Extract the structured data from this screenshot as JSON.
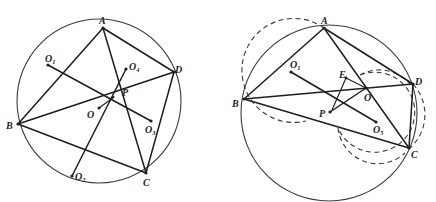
{
  "figures": [
    {
      "id": "left",
      "circle_label": "circumcircle",
      "points": [
        {
          "name": "A",
          "label": "A"
        },
        {
          "name": "B",
          "label": "B"
        },
        {
          "name": "C",
          "label": "C"
        },
        {
          "name": "D",
          "label": "D"
        },
        {
          "name": "O",
          "label": "O"
        },
        {
          "name": "P",
          "label": "P"
        },
        {
          "name": "O1",
          "label": "O",
          "sub": "1"
        },
        {
          "name": "O2",
          "label": "O",
          "sub": "2"
        },
        {
          "name": "O3",
          "label": "O",
          "sub": "3"
        },
        {
          "name": "O4",
          "label": "O",
          "sub": "4"
        }
      ],
      "segments": [
        "AB",
        "AD",
        "AC",
        "BD",
        "BC",
        "DC",
        "O1-O3",
        "O2-O4"
      ]
    },
    {
      "id": "right",
      "circle_label": "circumcircle",
      "points": [
        {
          "name": "A",
          "label": "A"
        },
        {
          "name": "B",
          "label": "B"
        },
        {
          "name": "C",
          "label": "C"
        },
        {
          "name": "D",
          "label": "D"
        },
        {
          "name": "E",
          "label": "E"
        },
        {
          "name": "O",
          "label": "O"
        },
        {
          "name": "P",
          "label": "P"
        },
        {
          "name": "O1",
          "label": "O",
          "sub": "1"
        },
        {
          "name": "O5",
          "label": "O",
          "sub": "5"
        }
      ],
      "segments": [
        "AB",
        "AD",
        "AC",
        "BD",
        "BC",
        "DC",
        "O1-O5",
        "O-P",
        "E-P"
      ],
      "dashed_circles": [
        "circle through A, B",
        "circle through D, C, P"
      ]
    }
  ]
}
